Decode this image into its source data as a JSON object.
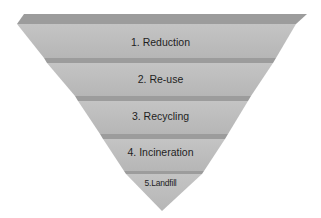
{
  "diagram": {
    "type": "inverted-pyramid",
    "colors": {
      "face": "#bdbdbd",
      "top_edge": "#9a9a9a",
      "background": "#ffffff",
      "text": "#1e1e1e"
    },
    "tiers": [
      {
        "label": "1. Reduction"
      },
      {
        "label": "2. Re-use"
      },
      {
        "label": "3. Recycling"
      },
      {
        "label": "4. Incineration"
      },
      {
        "label": "5.Landfill"
      }
    ]
  }
}
